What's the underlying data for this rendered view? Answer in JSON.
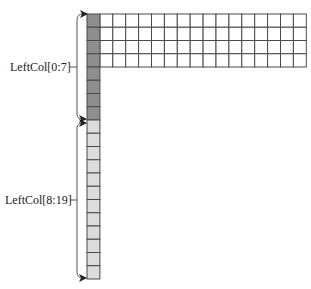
{
  "diagram": {
    "labels": {
      "upper": "LeftCol[0:7]",
      "lower": "LeftCol[8:19]"
    },
    "grid": {
      "left_column_rows": 20,
      "dark_rows": 8,
      "light_rows": 12,
      "top_block_rows": 4,
      "top_block_white_columns": 16
    },
    "colors": {
      "dark_cell": "#8e8e8e",
      "light_cell": "#dcdcdc",
      "white_cell": "#ffffff",
      "line": "#4a4a4a",
      "bracket": "#555555"
    }
  }
}
